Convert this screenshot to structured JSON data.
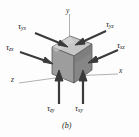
{
  "figure": {
    "caption": "(b)",
    "axes": [
      {
        "name": "y-axis-label",
        "label": "y"
      },
      {
        "name": "x-axis-label",
        "label": "x"
      },
      {
        "name": "z-axis-label",
        "label": "z"
      }
    ],
    "stress_labels": [
      {
        "name": "tau-yx-label",
        "symbol": "τ",
        "subscript": "yx"
      },
      {
        "name": "tau-yz-label",
        "symbol": "τ",
        "subscript": "yz"
      },
      {
        "name": "tau-zx-label",
        "symbol": "τ",
        "subscript": "zx"
      },
      {
        "name": "tau-xz-label",
        "symbol": "τ",
        "subscript": "xz"
      },
      {
        "name": "tau-zy-label",
        "symbol": "τ",
        "subscript": "zy"
      },
      {
        "name": "tau-xy-label",
        "symbol": "τ",
        "subscript": "xy"
      }
    ],
    "colors": {
      "cube_top": "#c6c6c6",
      "cube_front": "#9a9a9a",
      "cube_right": "#8a8a8a",
      "cube_edge": "#5a5a5a",
      "arrow": "#3a3a3a",
      "axis_line": "#a8a8a8",
      "background": "#fdfdfd"
    }
  }
}
